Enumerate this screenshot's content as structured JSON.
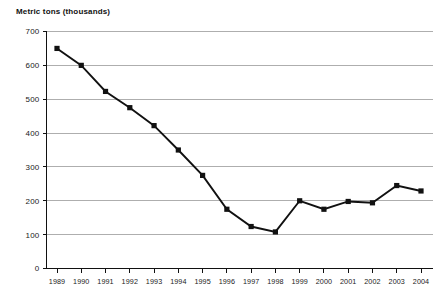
{
  "chart": {
    "title": "Metric tons (thousands)"
  },
  "chart_data": {
    "type": "line",
    "title": "Metric tons (thousands)",
    "xlabel": "",
    "ylabel": "Metric tons (thousands)",
    "categories": [
      "1989",
      "1990",
      "1991",
      "1992",
      "1993",
      "1994",
      "1995",
      "1996",
      "1997",
      "1998",
      "1999",
      "2000",
      "2001",
      "2002",
      "2003",
      "2004"
    ],
    "values": [
      650,
      600,
      523,
      475,
      422,
      350,
      275,
      175,
      124,
      108,
      200,
      175,
      198,
      194,
      245,
      229
    ],
    "ylim": [
      0,
      700
    ],
    "ytick_labels": [
      "0",
      "100",
      "200",
      "300",
      "400",
      "500",
      "600",
      "700"
    ],
    "ytick_values": [
      0,
      100,
      200,
      300,
      400,
      500,
      600,
      700
    ],
    "grid": true,
    "legend": "none",
    "series_color": "#111111",
    "grid_color": "#9a9a9a",
    "marker": "square"
  }
}
